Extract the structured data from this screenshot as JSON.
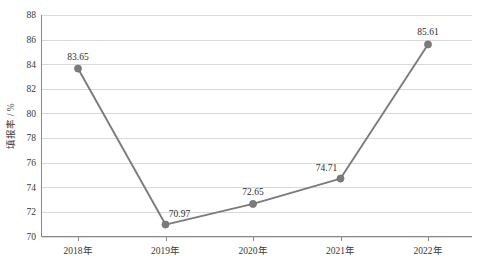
{
  "chart_data": {
    "type": "line",
    "title": "",
    "xlabel": "",
    "ylabel": "填报率 / %",
    "categories": [
      "2018年",
      "2019年",
      "2020年",
      "2021年",
      "2022年"
    ],
    "values": [
      83.65,
      70.97,
      72.65,
      74.71,
      85.61
    ],
    "point_labels": [
      "83.65",
      "70.97",
      "72.65",
      "74.71",
      "85.61"
    ],
    "ylim": [
      70,
      88
    ],
    "ytick_labels": [
      "70",
      "72",
      "74",
      "76",
      "78",
      "80",
      "82",
      "84",
      "86",
      "88"
    ],
    "ytick_values": [
      70,
      72,
      74,
      76,
      78,
      80,
      82,
      84,
      86,
      88
    ],
    "grid": "horizontal",
    "legend": "none",
    "series": [
      {
        "name": "填报率",
        "values": [
          83.65,
          70.97,
          72.65,
          74.71,
          85.61
        ]
      }
    ],
    "colors": {
      "line": "#7b7b7b",
      "marker": "#7b7b7b",
      "gridline": "#d9d9d9",
      "axis": "#8a8a8a",
      "text": "#3a3a3a",
      "background": "#ffffff"
    }
  }
}
